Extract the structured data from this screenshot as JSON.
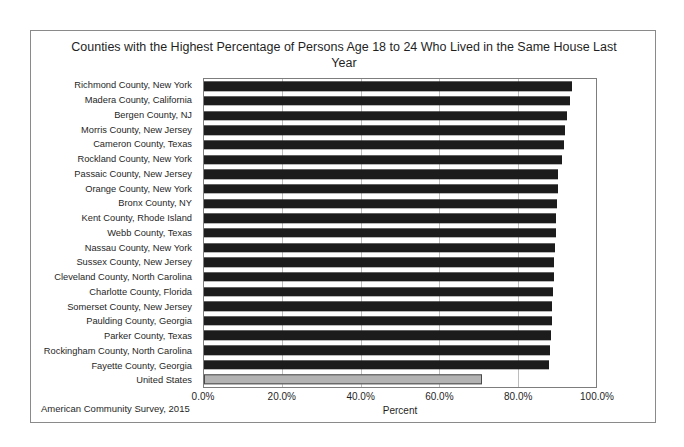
{
  "chart_data": {
    "type": "bar",
    "orientation": "horizontal",
    "title": "Counties with the Highest Percentage of Persons Age 18 to 24 Who Lived in the Same House Last Year",
    "xlabel": "Percent",
    "ylabel": "",
    "source_note": "American Community Survey, 2015",
    "xlim": [
      0,
      100
    ],
    "xticks": [
      "0.0%",
      "20.0%",
      "40.0%",
      "60.0%",
      "80.0%",
      "100.0%"
    ],
    "xtick_values": [
      0,
      20,
      40,
      60,
      80,
      100
    ],
    "grid": "vertical",
    "legend": "none",
    "categories": [
      "Richmond County, New York",
      "Madera County, California",
      "Bergen County, NJ",
      "Morris County, New Jersey",
      "Cameron County, Texas",
      "Rockland County, New York",
      "Passaic County, New Jersey",
      "Orange County, New York",
      "Bronx County, NY",
      "Kent County, Rhode Island",
      "Webb County, Texas",
      "Nassau County, New York",
      "Sussex County, New Jersey",
      "Cleveland County, North Carolina",
      "Charlotte County, Florida",
      "Somerset County, New Jersey",
      "Paulding County, Georgia",
      "Parker County, Texas",
      "Rockingham County, North Carolina",
      "Fayette County, Georgia",
      "United States"
    ],
    "values": [
      93.9,
      93.4,
      92.6,
      92.0,
      91.8,
      91.3,
      90.4,
      90.2,
      90.0,
      89.8,
      89.7,
      89.6,
      89.4,
      89.2,
      89.1,
      88.9,
      88.7,
      88.5,
      88.3,
      88.0,
      70.8
    ],
    "bar_colors": [
      "#1c1c1c",
      "#1c1c1c",
      "#1c1c1c",
      "#1c1c1c",
      "#1c1c1c",
      "#1c1c1c",
      "#1c1c1c",
      "#1c1c1c",
      "#1c1c1c",
      "#1c1c1c",
      "#1c1c1c",
      "#1c1c1c",
      "#1c1c1c",
      "#1c1c1c",
      "#1c1c1c",
      "#1c1c1c",
      "#1c1c1c",
      "#1c1c1c",
      "#1c1c1c",
      "#1c1c1c",
      "#b3b3b3"
    ],
    "highlight_category": "United States"
  }
}
